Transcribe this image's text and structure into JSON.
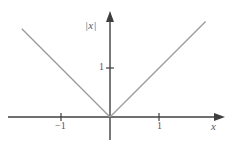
{
  "chart_data": {
    "type": "line",
    "title": "",
    "subtitle": "",
    "function": "y = |x|",
    "xlabel": "x",
    "ylabel": "|x|",
    "xlim": [
      -2.1,
      2.1
    ],
    "ylim": [
      -0.55,
      2.15
    ],
    "grid": false,
    "legend": null,
    "x_ticks": [
      {
        "value": -1,
        "label": "−1"
      },
      {
        "value": 1,
        "label": "1"
      }
    ],
    "y_ticks": [
      {
        "value": 1,
        "label": "1"
      }
    ],
    "series": [
      {
        "name": "|x|",
        "color": "#9a9a9a",
        "points": [
          {
            "x": -1.8,
            "y": 1.8
          },
          {
            "x": 0,
            "y": 0
          },
          {
            "x": 1.95,
            "y": 1.95
          }
        ]
      }
    ],
    "axes": {
      "color": "#3f3f3f",
      "x_axis_arrow": true,
      "y_axis_arrow": true,
      "origin_label": ""
    },
    "annotations": []
  },
  "labels": {
    "ylabel": "|x|",
    "xlabel": "x",
    "xtick_negative_one": "−1",
    "xtick_positive_one": "1",
    "ytick_one": "1"
  },
  "colors": {
    "background": "#ffffff",
    "curve": "#9a9a9a",
    "axis": "#3f3f3f",
    "text": "#585858"
  }
}
